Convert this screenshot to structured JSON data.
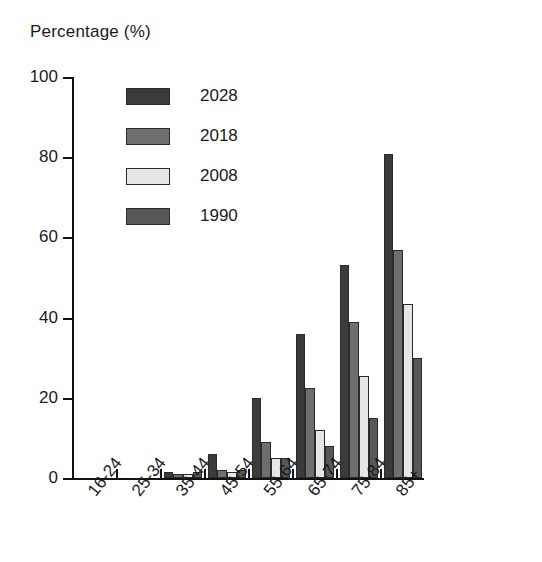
{
  "chart_data": {
    "type": "bar",
    "title": "",
    "ylabel": "Percentage (%)",
    "xlabel": "",
    "ylim": [
      0,
      100
    ],
    "yticks": [
      0,
      20,
      40,
      60,
      80,
      100
    ],
    "grid": false,
    "legend_position": "top-left-inside",
    "categories": [
      "16-24",
      "25-34",
      "35-44",
      "45-54",
      "55-64",
      "65-74",
      "75-84",
      "85+"
    ],
    "series": [
      {
        "name": "2028",
        "color": "#3b3b3b",
        "values": [
          0,
          0,
          1.5,
          6,
          20,
          36,
          53,
          80.8
        ]
      },
      {
        "name": "2018",
        "color": "#6e6e6e",
        "values": [
          0,
          0,
          1,
          2,
          9,
          22.5,
          39,
          56.8
        ]
      },
      {
        "name": "2008",
        "color": "#e6e6e6",
        "values": [
          0,
          0,
          1,
          1.5,
          5,
          12,
          25.5,
          43.5
        ]
      },
      {
        "name": "1990",
        "color": "#585858",
        "values": [
          0,
          0,
          1.5,
          2,
          5,
          8,
          15,
          30
        ]
      }
    ]
  },
  "legend": {
    "entries": [
      {
        "label": "2028"
      },
      {
        "label": "2018"
      },
      {
        "label": "2008"
      },
      {
        "label": "1990"
      }
    ]
  }
}
